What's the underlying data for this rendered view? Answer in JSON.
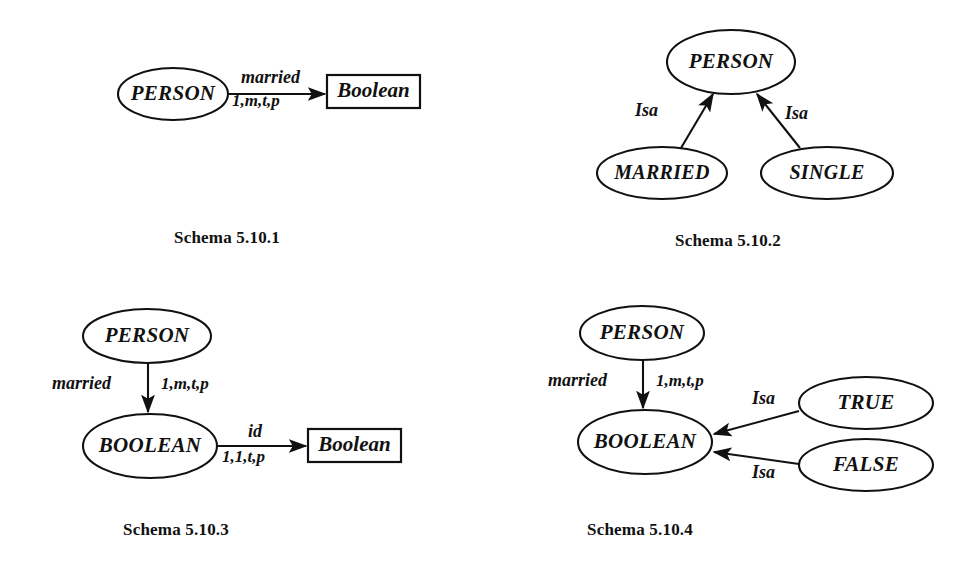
{
  "page": {
    "background": "#ffffff",
    "ink": "#111111",
    "width": 977,
    "height": 575
  },
  "figures": [
    {
      "id": "schema-5-10-1",
      "caption": "Schema 5.10.1",
      "nodes": [
        {
          "id": "person",
          "shape": "ellipse",
          "label": "PERSON"
        },
        {
          "id": "boolean_domain",
          "shape": "box",
          "label": "Boolean"
        }
      ],
      "edges": [
        {
          "id": "married",
          "from": "person",
          "to": "boolean_domain",
          "label_top": "married",
          "label_bottom": "1,m,t,p",
          "arrowhead": "filled"
        }
      ]
    },
    {
      "id": "schema-5-10-2",
      "caption": "Schema 5.10.2",
      "nodes": [
        {
          "id": "person",
          "shape": "ellipse",
          "label": "PERSON"
        },
        {
          "id": "married",
          "shape": "ellipse",
          "label": "MARRIED"
        },
        {
          "id": "single",
          "shape": "ellipse",
          "label": "SINGLE"
        }
      ],
      "edges": [
        {
          "id": "isa-married",
          "from": "married",
          "to": "person",
          "label_top": "Isa",
          "arrowhead": "filled"
        },
        {
          "id": "isa-single",
          "from": "single",
          "to": "person",
          "label_top": "Isa",
          "arrowhead": "filled"
        }
      ]
    },
    {
      "id": "schema-5-10-3",
      "caption": "Schema 5.10.3",
      "nodes": [
        {
          "id": "person",
          "shape": "ellipse",
          "label": "PERSON"
        },
        {
          "id": "boolean_class",
          "shape": "ellipse",
          "label": "BOOLEAN"
        },
        {
          "id": "boolean_domain",
          "shape": "box",
          "label": "Boolean"
        }
      ],
      "edges": [
        {
          "id": "married",
          "from": "person",
          "to": "boolean_class",
          "label_left": "married",
          "label_right": "1,m,t,p",
          "arrowhead": "filled"
        },
        {
          "id": "id",
          "from": "boolean_class",
          "to": "boolean_domain",
          "label_top": "id",
          "label_bottom": "1,1,t,p",
          "arrowhead": "filled"
        }
      ]
    },
    {
      "id": "schema-5-10-4",
      "caption": "Schema 5.10.4",
      "nodes": [
        {
          "id": "person",
          "shape": "ellipse",
          "label": "PERSON"
        },
        {
          "id": "boolean_class",
          "shape": "ellipse",
          "label": "BOOLEAN"
        },
        {
          "id": "true",
          "shape": "ellipse",
          "label": "TRUE"
        },
        {
          "id": "false",
          "shape": "ellipse",
          "label": "FALSE"
        }
      ],
      "edges": [
        {
          "id": "married",
          "from": "person",
          "to": "boolean_class",
          "label_left": "married",
          "label_right": "1,m,t,p",
          "arrowhead": "filled"
        },
        {
          "id": "isa-true",
          "from": "true",
          "to": "boolean_class",
          "label_top": "Isa",
          "arrowhead": "filled"
        },
        {
          "id": "isa-false",
          "from": "false",
          "to": "boolean_class",
          "label_top": "Isa",
          "arrowhead": "filled"
        }
      ]
    }
  ]
}
